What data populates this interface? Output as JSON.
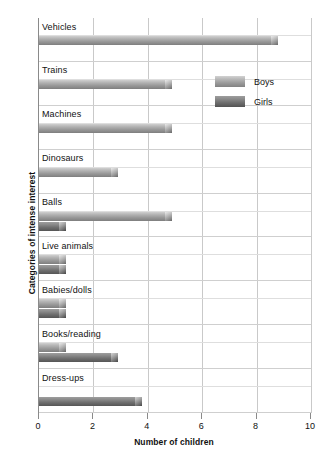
{
  "chart_data": {
    "type": "bar",
    "orientation": "horizontal",
    "title": "",
    "xlabel": "Number of children",
    "ylabel": "Categories of intense interest",
    "xlim": [
      0,
      10
    ],
    "xticks": [
      "0",
      "2",
      "4",
      "6",
      "8",
      "10"
    ],
    "grid": true,
    "legend_position": "upper-right",
    "categories": [
      "Vehicles",
      "Trains",
      "Machines",
      "Dinosaurs",
      "Balls",
      "Live animals",
      "Babies/dolls",
      "Books/reading",
      "Dress-ups"
    ],
    "series": [
      {
        "name": "Boys",
        "color": "#b4b4b4",
        "values": [
          8.8,
          4.9,
          4.9,
          2.9,
          4.9,
          1.0,
          1.0,
          1.0,
          0.0
        ]
      },
      {
        "name": "Girls",
        "color": "#6f6f6f",
        "values": [
          0.0,
          0.0,
          0.0,
          0.0,
          1.0,
          1.0,
          1.0,
          2.9,
          3.8
        ]
      }
    ]
  },
  "legend": {
    "items": [
      {
        "label": "Boys"
      },
      {
        "label": "Girls"
      }
    ]
  },
  "ghost_title": ""
}
